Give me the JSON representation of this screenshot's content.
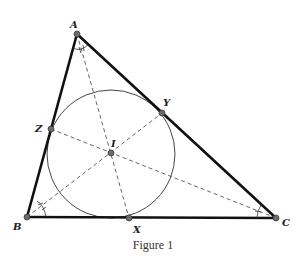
{
  "figure": {
    "caption": "Figure 1",
    "colors": {
      "sides": "#111111",
      "dashed": "#555555",
      "circle": "#444444",
      "points": "#6b6b6b",
      "background": "#ffffff"
    },
    "points": {
      "A": {
        "label": "A",
        "x": 77,
        "y": 34
      },
      "B": {
        "label": "B",
        "x": 27,
        "y": 217
      },
      "C": {
        "label": "C",
        "x": 276,
        "y": 218
      },
      "I": {
        "label": "I",
        "x": 111,
        "y": 153
      },
      "X": {
        "label": "X",
        "x": 129,
        "y": 218
      },
      "Y": {
        "label": "Y",
        "x": 162,
        "y": 113
      },
      "Z": {
        "label": "Z",
        "x": 51,
        "y": 129
      }
    },
    "incircle": {
      "cx": 111,
      "cy": 154,
      "r": 64
    },
    "segments": {
      "sides": [
        "AB",
        "BC",
        "CA"
      ],
      "angle_bisectors": [
        "A-I-X (extended)",
        "B-I-Y",
        "C-I-Z"
      ]
    }
  }
}
